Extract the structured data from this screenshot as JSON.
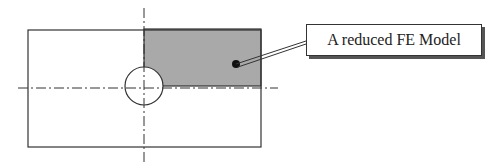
{
  "diagram": {
    "label": "A reduced FE Model",
    "colors": {
      "line": "#333333",
      "shaded_region": "#a9a9a9",
      "background": "#ffffff"
    }
  }
}
